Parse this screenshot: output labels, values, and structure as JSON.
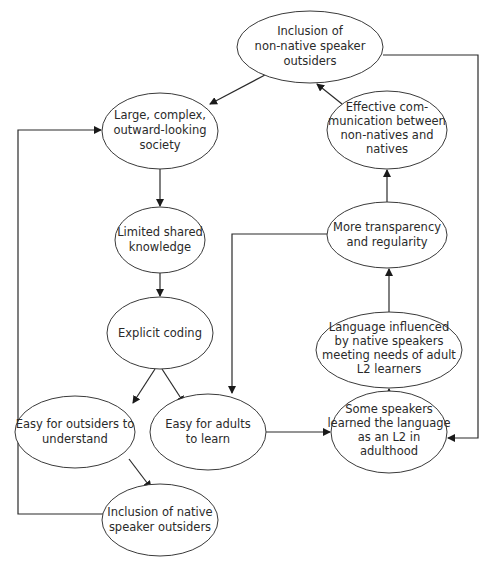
{
  "diagram": {
    "type": "flowchart",
    "nodes": [
      {
        "id": "incl_nonnative",
        "lines": [
          "Inclusion of",
          "non-native speaker",
          "outsiders"
        ],
        "cx": 310,
        "cy": 47,
        "rx": 73,
        "ry": 36
      },
      {
        "id": "large_society",
        "lines": [
          "Large, complex,",
          "outward-looking",
          "society"
        ],
        "cx": 160,
        "cy": 131,
        "rx": 58,
        "ry": 38
      },
      {
        "id": "effective_comm",
        "lines": [
          "Effective com-",
          "munication between",
          "non-natives and",
          "natives"
        ],
        "cx": 387,
        "cy": 130,
        "rx": 60,
        "ry": 39
      },
      {
        "id": "limited_knowledge",
        "lines": [
          "Limited shared",
          "knowledge"
        ],
        "cx": 160,
        "cy": 240,
        "rx": 45,
        "ry": 33
      },
      {
        "id": "transparency",
        "lines": [
          "More transparency",
          "and regularity"
        ],
        "cx": 387,
        "cy": 235,
        "rx": 60,
        "ry": 33
      },
      {
        "id": "explicit_coding",
        "lines": [
          "Explicit coding"
        ],
        "cx": 160,
        "cy": 333,
        "rx": 53,
        "ry": 36
      },
      {
        "id": "lang_influenced",
        "lines": [
          "Language influenced",
          "by native speakers",
          "meeting needs of adult",
          "L2 learners"
        ],
        "cx": 389,
        "cy": 350,
        "rx": 73,
        "ry": 38
      },
      {
        "id": "easy_outsiders",
        "lines": [
          "Easy for outsiders to",
          "understand"
        ],
        "cx": 75,
        "cy": 432,
        "rx": 60,
        "ry": 36
      },
      {
        "id": "easy_adults",
        "lines": [
          "Easy for adults",
          "to learn"
        ],
        "cx": 208,
        "cy": 432,
        "rx": 58,
        "ry": 38
      },
      {
        "id": "some_speakers",
        "lines": [
          "Some speakers",
          "learned the language",
          "as an L2 in",
          "adulthood"
        ],
        "cx": 389,
        "cy": 432,
        "rx": 58,
        "ry": 41
      },
      {
        "id": "incl_native",
        "lines": [
          "Inclusion of native",
          "speaker outsiders"
        ],
        "cx": 160,
        "cy": 520,
        "rx": 58,
        "ry": 36
      }
    ],
    "edges": [
      {
        "from": "incl_nonnative",
        "to": "large_society"
      },
      {
        "from": "large_society",
        "to": "limited_knowledge"
      },
      {
        "from": "limited_knowledge",
        "to": "explicit_coding"
      },
      {
        "from": "explicit_coding",
        "to": "easy_outsiders"
      },
      {
        "from": "explicit_coding",
        "to": "easy_adults"
      },
      {
        "from": "easy_outsiders",
        "to": "incl_native"
      },
      {
        "from": "incl_native",
        "to": "large_society",
        "routing": "left loop"
      },
      {
        "from": "easy_adults",
        "to": "some_speakers"
      },
      {
        "from": "some_speakers",
        "to": "lang_influenced"
      },
      {
        "from": "lang_influenced",
        "to": "transparency"
      },
      {
        "from": "transparency",
        "to": "effective_comm"
      },
      {
        "from": "transparency",
        "to": "easy_adults",
        "routing": "elbow left then down"
      },
      {
        "from": "effective_comm",
        "to": "incl_nonnative"
      },
      {
        "from": "incl_nonnative",
        "to": "some_speakers",
        "routing": "right loop"
      }
    ]
  },
  "colors": {
    "stroke": "#3a3a3a",
    "text": "#2a2a2a",
    "background": "#ffffff"
  }
}
